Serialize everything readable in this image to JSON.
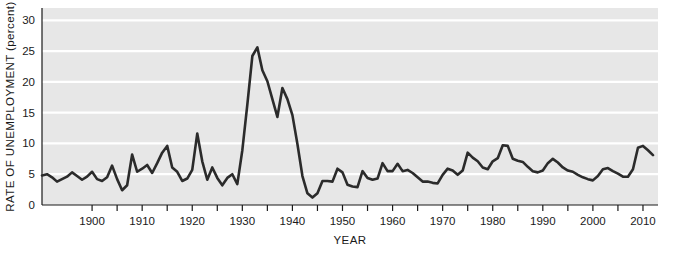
{
  "chart_data": {
    "type": "line",
    "title": "",
    "xlabel": "YEAR",
    "ylabel": "RATE OF UNEMPLOYMENT (percent)",
    "xlim": [
      1890,
      2013
    ],
    "ylim": [
      0,
      32
    ],
    "grid": true,
    "legend": "none",
    "y_ticks": [
      0,
      5,
      10,
      15,
      20,
      25,
      30
    ],
    "y_tick_labels": [
      "0",
      "5",
      "10",
      "15",
      "20",
      "25",
      "30"
    ],
    "x_ticks": [
      1900,
      1905,
      1910,
      1915,
      1920,
      1925,
      1930,
      1935,
      1940,
      1945,
      1950,
      1955,
      1960,
      1965,
      1970,
      1975,
      1980,
      1985,
      1990,
      1995,
      2000,
      2005,
      2010
    ],
    "x_tick_labels_major": [
      "1900",
      "1910",
      "1920",
      "1930",
      "1940",
      "1950",
      "1960",
      "1970",
      "1980",
      "1990",
      "2000",
      "2010"
    ],
    "x_major_ticks": [
      1900,
      1910,
      1920,
      1930,
      1940,
      1950,
      1960,
      1970,
      1980,
      1990,
      2000,
      2010
    ],
    "series_name": "Rate of unemployment",
    "line_color": "#2b2b2b",
    "plot_background": "#e7e7e7",
    "gridline_color": "#ffffff",
    "x": [
      1890,
      1891,
      1892,
      1893,
      1894,
      1895,
      1896,
      1897,
      1898,
      1899,
      1900,
      1901,
      1902,
      1903,
      1904,
      1905,
      1906,
      1907,
      1908,
      1909,
      1910,
      1911,
      1912,
      1913,
      1914,
      1915,
      1916,
      1917,
      1918,
      1919,
      1920,
      1921,
      1922,
      1923,
      1924,
      1925,
      1926,
      1927,
      1928,
      1929,
      1930,
      1931,
      1932,
      1933,
      1934,
      1935,
      1936,
      1937,
      1938,
      1939,
      1940,
      1941,
      1942,
      1943,
      1944,
      1945,
      1946,
      1947,
      1948,
      1949,
      1950,
      1951,
      1952,
      1953,
      1954,
      1955,
      1956,
      1957,
      1958,
      1959,
      1960,
      1961,
      1962,
      1963,
      1964,
      1965,
      1966,
      1967,
      1968,
      1969,
      1970,
      1971,
      1972,
      1973,
      1974,
      1975,
      1976,
      1977,
      1978,
      1979,
      1980,
      1981,
      1982,
      1983,
      1984,
      1985,
      1986,
      1987,
      1988,
      1989,
      1990,
      1991,
      1992,
      1993,
      1994,
      1995,
      1996,
      1997,
      1998,
      1999,
      2000,
      2001,
      2002,
      2003,
      2004,
      2005,
      2006,
      2007,
      2008,
      2009,
      2010,
      2011,
      2012
    ],
    "values": [
      4.8,
      5.0,
      4.5,
      3.8,
      4.2,
      4.6,
      5.3,
      4.7,
      4.1,
      4.6,
      5.4,
      4.2,
      3.9,
      4.5,
      6.4,
      4.2,
      2.4,
      3.2,
      8.2,
      5.4,
      5.9,
      6.5,
      5.2,
      6.8,
      8.5,
      9.6,
      6.1,
      5.4,
      3.9,
      4.3,
      5.7,
      11.6,
      7.1,
      4.1,
      6.1,
      4.4,
      3.2,
      4.4,
      5.0,
      3.4,
      8.9,
      16.3,
      24.2,
      25.6,
      21.9,
      20.1,
      17.2,
      14.3,
      19.0,
      17.2,
      14.6,
      9.9,
      4.7,
      1.9,
      1.2,
      1.9,
      3.9,
      3.9,
      3.8,
      5.9,
      5.3,
      3.3,
      3.0,
      2.9,
      5.5,
      4.4,
      4.1,
      4.3,
      6.8,
      5.5,
      5.5,
      6.7,
      5.5,
      5.7,
      5.2,
      4.5,
      3.8,
      3.8,
      3.6,
      3.5,
      4.9,
      5.9,
      5.6,
      4.9,
      5.6,
      8.5,
      7.7,
      7.1,
      6.1,
      5.8,
      7.1,
      7.6,
      9.7,
      9.6,
      7.5,
      7.2,
      7.0,
      6.2,
      5.5,
      5.3,
      5.6,
      6.8,
      7.5,
      6.9,
      6.1,
      5.6,
      5.4,
      4.9,
      4.5,
      4.2,
      4.0,
      4.7,
      5.8,
      6.0,
      5.5,
      5.1,
      4.6,
      4.6,
      5.8,
      9.3,
      9.6,
      8.9,
      8.1
    ],
    "annotations": []
  },
  "axis_labels": {
    "y_title": "RATE OF UNEMPLOYMENT (percent)",
    "x_title": "YEAR"
  }
}
